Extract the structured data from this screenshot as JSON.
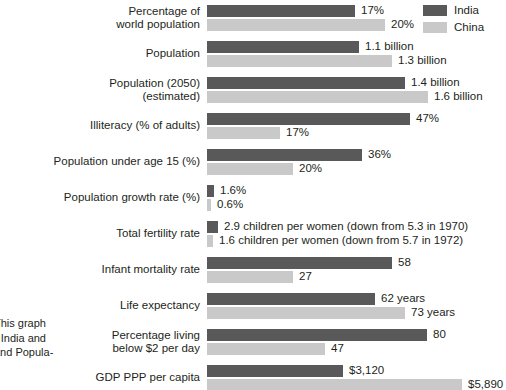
{
  "legend": {
    "items": [
      {
        "label": "India",
        "color": "#595959",
        "key": "india"
      },
      {
        "label": "China",
        "color": "#c9c9c9",
        "key": "china"
      }
    ]
  },
  "side_caption": {
    "line1": "This graph",
    "line2": "r India and",
    "line3": "and Popula-"
  },
  "chart_data": {
    "type": "bar",
    "orientation": "horizontal",
    "title": "",
    "xlabel": "",
    "ylabel": "",
    "grid": false,
    "legend_position": "top-right",
    "series": [
      {
        "name": "India",
        "color": "#595959"
      },
      {
        "name": "China",
        "color": "#c9c9c9"
      }
    ],
    "categories": [
      "Percentage of world population",
      "Population",
      "Population (2050) (estimated)",
      "Illiteracy (% of adults)",
      "Population under age 15 (%)",
      "Population growth rate (%)",
      "Total fertility rate",
      "Infant mortality rate",
      "Life expectancy",
      "Percentage living below $2 per day",
      "GDP PPP per capita"
    ],
    "rows": [
      {
        "label_lines": [
          "Percentage of",
          "world population"
        ],
        "india": {
          "value": 17,
          "display": "17%",
          "bar_px": 148
        },
        "china": {
          "value": 20,
          "display": "20%",
          "bar_px": 178
        }
      },
      {
        "label_lines": [
          "Population"
        ],
        "india": {
          "value": 1.1,
          "display": "1.1 billion",
          "bar_px": 152
        },
        "china": {
          "value": 1.3,
          "display": "1.3 billion",
          "bar_px": 185
        }
      },
      {
        "label_lines": [
          "Population (2050)",
          "(estimated)"
        ],
        "india": {
          "value": 1.4,
          "display": "1.4 billion",
          "bar_px": 198
        },
        "china": {
          "value": 1.6,
          "display": "1.6 billion",
          "bar_px": 221
        }
      },
      {
        "label_lines": [
          "Illiteracy (% of adults)"
        ],
        "india": {
          "value": 47,
          "display": "47%",
          "bar_px": 203
        },
        "china": {
          "value": 17,
          "display": "17%",
          "bar_px": 73
        }
      },
      {
        "label_lines": [
          "Population under age 15 (%)"
        ],
        "india": {
          "value": 36,
          "display": "36%",
          "bar_px": 155
        },
        "china": {
          "value": 20,
          "display": "20%",
          "bar_px": 86
        }
      },
      {
        "label_lines": [
          "Population growth rate (%)"
        ],
        "india": {
          "value": 1.6,
          "display": "1.6%",
          "bar_px": 7
        },
        "china": {
          "value": 0.6,
          "display": "0.6%",
          "bar_px": 4
        }
      },
      {
        "label_lines": [
          "Total fertility rate"
        ],
        "india": {
          "value": 2.9,
          "display": "2.9 children per women (down from 5.3 in 1970)",
          "bar_px": 11
        },
        "china": {
          "value": 1.6,
          "display": "1.6 children per women (down from 5.7 in 1972)",
          "bar_px": 6
        }
      },
      {
        "label_lines": [
          "Infant mortality rate"
        ],
        "india": {
          "value": 58,
          "display": "58",
          "bar_px": 185
        },
        "china": {
          "value": 27,
          "display": "27",
          "bar_px": 86
        }
      },
      {
        "label_lines": [
          "Life expectancy"
        ],
        "india": {
          "value": 62,
          "display": "62 years",
          "bar_px": 168
        },
        "china": {
          "value": 73,
          "display": "73 years",
          "bar_px": 198
        }
      },
      {
        "label_lines": [
          "Percentage living",
          "below $2 per day"
        ],
        "india": {
          "value": 80,
          "display": "80",
          "bar_px": 220
        },
        "china": {
          "value": 47,
          "display": "47",
          "bar_px": 118
        }
      },
      {
        "label_lines": [
          "GDP PPP per capita"
        ],
        "india": {
          "value": 3120,
          "display": "$3,120",
          "bar_px": 136
        },
        "china": {
          "value": 5890,
          "display": "$5,890",
          "bar_px": 255
        }
      }
    ]
  }
}
